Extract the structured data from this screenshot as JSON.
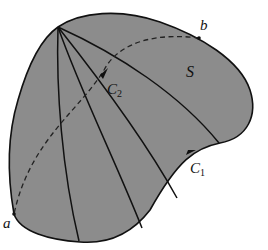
{
  "diagram": {
    "title": "",
    "colors": {
      "region_fill": "#8c8c8c",
      "stroke": "#111111",
      "background": "#ffffff"
    },
    "region": {
      "label": "S"
    },
    "curves": [
      {
        "id": "C1",
        "label_main": "C",
        "label_sub": "1",
        "style": "solid",
        "description": "boundary curve with arrow"
      },
      {
        "id": "C2",
        "label_main": "C",
        "label_sub": "2",
        "style": "dashed",
        "description": "dashed curve from b to a with arrow"
      }
    ],
    "points": [
      {
        "id": "a",
        "label": "a"
      },
      {
        "id": "b",
        "label": "b"
      }
    ],
    "interior_lines": 4
  }
}
